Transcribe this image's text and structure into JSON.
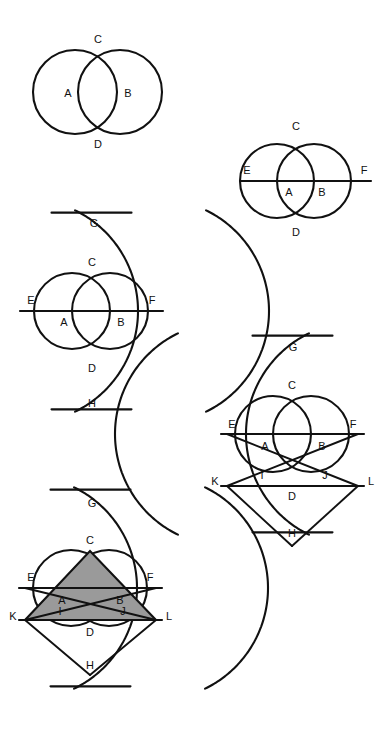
{
  "document": {
    "title": "Vesica Piscis Geometric Construction Sequence",
    "background_color": "#ffffff",
    "ink_color": "#111111",
    "shade_color": "#9a9a9a",
    "width": 391,
    "height": 736
  },
  "figures": [
    {
      "id": "figure-1",
      "name": "two-overlapping-circles",
      "caption": "",
      "circles": [
        {
          "name": "circle-a",
          "cx": 75,
          "cy": 92,
          "r": 42
        },
        {
          "name": "circle-b",
          "cx": 120,
          "cy": 92,
          "r": 42
        }
      ],
      "lines": [],
      "labels": [
        {
          "text": "C",
          "x": 98,
          "y": 40
        },
        {
          "text": "A",
          "x": 68,
          "y": 94
        },
        {
          "text": "B",
          "x": 128,
          "y": 94
        },
        {
          "text": "D",
          "x": 98,
          "y": 145
        }
      ]
    },
    {
      "id": "figure-2",
      "name": "circles-with-diameter-line-ef",
      "caption": "",
      "circles": [
        {
          "name": "circle-a",
          "cx": 277,
          "cy": 181,
          "r": 37
        },
        {
          "name": "circle-b",
          "cx": 314,
          "cy": 181,
          "r": 37
        }
      ],
      "lines": [
        {
          "name": "line-ef",
          "x1": 240,
          "y1": 181,
          "x2": 371,
          "y2": 181
        }
      ],
      "labels": [
        {
          "text": "C",
          "x": 296,
          "y": 127
        },
        {
          "text": "E",
          "x": 247,
          "y": 171
        },
        {
          "text": "F",
          "x": 364,
          "y": 171
        },
        {
          "text": "A",
          "x": 289,
          "y": 193
        },
        {
          "text": "B",
          "x": 322,
          "y": 193
        },
        {
          "text": "D",
          "x": 296,
          "y": 233
        }
      ]
    },
    {
      "id": "figure-3",
      "name": "vesica-with-arcs-g-h",
      "caption": "",
      "circles": [
        {
          "name": "circle-a",
          "cx": 72,
          "cy": 311,
          "r": 38
        },
        {
          "name": "circle-b",
          "cx": 110,
          "cy": 311,
          "r": 38
        }
      ],
      "arcs": [
        {
          "name": "arc-from-e",
          "cx": 26,
          "cy": 311,
          "r": 112
        },
        {
          "name": "arc-from-f",
          "cx": 157,
          "cy": 311,
          "r": 112
        }
      ],
      "lines": [
        {
          "name": "line-ef",
          "x1": 20,
          "y1": 311,
          "x2": 163,
          "y2": 311
        }
      ],
      "labels": [
        {
          "text": "G",
          "x": 94,
          "y": 224
        },
        {
          "text": "C",
          "x": 92,
          "y": 263
        },
        {
          "text": "E",
          "x": 31,
          "y": 301
        },
        {
          "text": "F",
          "x": 152,
          "y": 301
        },
        {
          "text": "A",
          "x": 64,
          "y": 323
        },
        {
          "text": "B",
          "x": 121,
          "y": 323
        },
        {
          "text": "D",
          "x": 92,
          "y": 369
        },
        {
          "text": "H",
          "x": 92,
          "y": 404
        }
      ]
    },
    {
      "id": "figure-4",
      "name": "construction-with-points-i-j-k-l",
      "caption": "",
      "circles": [
        {
          "name": "circle-a",
          "cx": 273,
          "cy": 434,
          "r": 38
        },
        {
          "name": "circle-b",
          "cx": 311,
          "cy": 434,
          "r": 38
        }
      ],
      "arcs": [
        {
          "name": "arc-from-e",
          "cx": 227,
          "cy": 434,
          "r": 112
        },
        {
          "name": "arc-from-f",
          "cx": 358,
          "cy": 434,
          "r": 112
        }
      ],
      "lines": [
        {
          "name": "line-ef",
          "x1": 221,
          "y1": 434,
          "x2": 364,
          "y2": 434
        },
        {
          "name": "line-kl",
          "x1": 221,
          "y1": 486,
          "x2": 364,
          "y2": 486
        },
        {
          "name": "line-e-to-l",
          "x1": 227,
          "y1": 434,
          "x2": 358,
          "y2": 486
        },
        {
          "name": "line-f-to-k",
          "x1": 358,
          "y1": 434,
          "x2": 227,
          "y2": 486
        },
        {
          "name": "line-k-to-h",
          "x1": 227,
          "y1": 486,
          "x2": 292,
          "y2": 546
        },
        {
          "name": "line-l-to-h",
          "x1": 358,
          "y1": 486,
          "x2": 292,
          "y2": 546
        }
      ],
      "labels": [
        {
          "text": "G",
          "x": 293,
          "y": 348
        },
        {
          "text": "C",
          "x": 292,
          "y": 386
        },
        {
          "text": "E",
          "x": 232,
          "y": 425
        },
        {
          "text": "F",
          "x": 353,
          "y": 425
        },
        {
          "text": "A",
          "x": 265,
          "y": 447
        },
        {
          "text": "B",
          "x": 322,
          "y": 447
        },
        {
          "text": "I",
          "x": 262,
          "y": 476
        },
        {
          "text": "J",
          "x": 325,
          "y": 476
        },
        {
          "text": "K",
          "x": 215,
          "y": 482
        },
        {
          "text": "L",
          "x": 371,
          "y": 482
        },
        {
          "text": "D",
          "x": 292,
          "y": 497
        },
        {
          "text": "H",
          "x": 292,
          "y": 534
        }
      ]
    },
    {
      "id": "figure-5",
      "name": "completed-construction-with-shaded-triangle",
      "caption": "",
      "circles": [
        {
          "name": "circle-a",
          "cx": 71,
          "cy": 588,
          "r": 38
        },
        {
          "name": "circle-b",
          "cx": 109,
          "cy": 588,
          "r": 38
        }
      ],
      "arcs": [
        {
          "name": "arc-from-e",
          "cx": 25,
          "cy": 588,
          "r": 112
        },
        {
          "name": "arc-from-f",
          "cx": 156,
          "cy": 588,
          "r": 112
        }
      ],
      "lines": [
        {
          "name": "line-ef",
          "x1": 19,
          "y1": 588,
          "x2": 162,
          "y2": 588
        },
        {
          "name": "line-kl",
          "x1": 19,
          "y1": 620,
          "x2": 162,
          "y2": 620
        },
        {
          "name": "line-e-to-l",
          "x1": 25,
          "y1": 588,
          "x2": 156,
          "y2": 620
        },
        {
          "name": "line-f-to-k",
          "x1": 156,
          "y1": 588,
          "x2": 25,
          "y2": 620
        },
        {
          "name": "line-k-to-h",
          "x1": 25,
          "y1": 620,
          "x2": 90,
          "y2": 675
        },
        {
          "name": "line-l-to-h",
          "x1": 156,
          "y1": 620,
          "x2": 90,
          "y2": 675
        }
      ],
      "shaded_triangle": {
        "name": "triangle-k-c-l",
        "fill": "#9a9a9a",
        "vertices": [
          {
            "label": "K",
            "x": 25,
            "y": 620
          },
          {
            "label": "C",
            "x": 90,
            "y": 551
          },
          {
            "label": "L",
            "x": 156,
            "y": 620
          }
        ]
      },
      "labels": [
        {
          "text": "G",
          "x": 92,
          "y": 504
        },
        {
          "text": "C",
          "x": 90,
          "y": 541
        },
        {
          "text": "E",
          "x": 31,
          "y": 578
        },
        {
          "text": "F",
          "x": 150,
          "y": 578
        },
        {
          "text": "A",
          "x": 62,
          "y": 601
        },
        {
          "text": "B",
          "x": 120,
          "y": 601
        },
        {
          "text": "I",
          "x": 60,
          "y": 612
        },
        {
          "text": "J",
          "x": 123,
          "y": 612
        },
        {
          "text": "K",
          "x": 13,
          "y": 617
        },
        {
          "text": "L",
          "x": 169,
          "y": 617
        },
        {
          "text": "D",
          "x": 90,
          "y": 633
        },
        {
          "text": "H",
          "x": 90,
          "y": 666
        }
      ]
    }
  ]
}
